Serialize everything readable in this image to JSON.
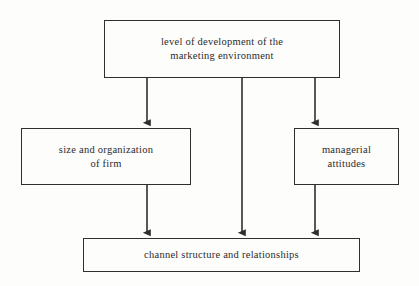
{
  "diagram": {
    "background_color": "#fdfdfc",
    "line_color": "#2f2f2f",
    "text_color": "#2b2b2b",
    "nodes": [
      {
        "id": "environment",
        "label": "level of development of the\nmarketing environment",
        "role": "top-driver"
      },
      {
        "id": "firm",
        "label": "size and organization\nof firm",
        "role": "mediator-left"
      },
      {
        "id": "attitudes",
        "label": "managerial\nattitudes",
        "role": "mediator-right"
      },
      {
        "id": "channel",
        "label": "channel structure and relationships",
        "role": "outcome"
      }
    ],
    "edges": [
      {
        "id": "edge-environment-firm",
        "from": "environment",
        "to": "firm",
        "style": "solid-arrow"
      },
      {
        "id": "edge-environment-channel",
        "from": "environment",
        "to": "channel",
        "style": "solid-arrow"
      },
      {
        "id": "edge-environment-attitudes",
        "from": "environment",
        "to": "attitudes",
        "style": "solid-arrow"
      },
      {
        "id": "edge-firm-channel",
        "from": "firm",
        "to": "channel",
        "style": "solid-arrow"
      },
      {
        "id": "edge-attitudes-channel",
        "from": "attitudes",
        "to": "channel",
        "style": "solid-arrow"
      }
    ]
  }
}
